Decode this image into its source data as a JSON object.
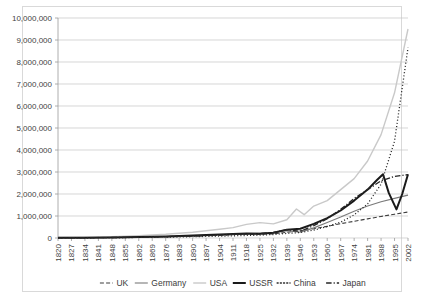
{
  "chart_data": {
    "type": "line",
    "title": "",
    "xlabel": "",
    "ylabel": "",
    "ylim": [
      0,
      10000000
    ],
    "ytick_values": [
      0,
      1000000,
      2000000,
      3000000,
      4000000,
      5000000,
      6000000,
      7000000,
      8000000,
      9000000,
      10000000
    ],
    "ytick_labels": [
      "0",
      "1,000,000",
      "2,000,000",
      "3,000,000",
      "4,000,000",
      "5,000,000",
      "6,000,000",
      "7,000,000",
      "8,000,000",
      "9,000,000",
      "10,000,000"
    ],
    "xlim": [
      1820,
      2002
    ],
    "xtick_labels": [
      "1820",
      "1827",
      "1834",
      "1841",
      "1848",
      "1855",
      "1862",
      "1869",
      "1876",
      "1883",
      "1890",
      "1897",
      "1904",
      "1911",
      "1918",
      "1925",
      "1932",
      "1939",
      "1946",
      "1953",
      "1960",
      "1967",
      "1974",
      "1981",
      "1988",
      "1995",
      "2002"
    ],
    "grid": "horizontal",
    "legend_position": "bottom",
    "series": [
      {
        "name": "UK",
        "style": "dashed",
        "color": "#3d3d3d",
        "width": 1.1,
        "dash": "4,2.2",
        "x": [
          1820,
          1834,
          1848,
          1862,
          1876,
          1890,
          1904,
          1918,
          1925,
          1932,
          1939,
          1946,
          1953,
          1960,
          1967,
          1974,
          1981,
          1988,
          1995,
          2002
        ],
        "y": [
          12000,
          20000,
          32000,
          48000,
          70000,
          95000,
          130000,
          180000,
          170000,
          190000,
          260000,
          330000,
          420000,
          530000,
          650000,
          760000,
          870000,
          980000,
          1080000,
          1180000
        ]
      },
      {
        "name": "Germany",
        "style": "solid",
        "color": "#7a7a7a",
        "width": 1.1,
        "dash": "",
        "x": [
          1820,
          1834,
          1848,
          1862,
          1876,
          1890,
          1904,
          1918,
          1925,
          1932,
          1939,
          1946,
          1953,
          1960,
          1967,
          1974,
          1981,
          1988,
          1995,
          2002
        ],
        "y": [
          8000,
          14000,
          24000,
          40000,
          65000,
          100000,
          150000,
          200000,
          210000,
          230000,
          330000,
          260000,
          460000,
          700000,
          950000,
          1220000,
          1450000,
          1650000,
          1800000,
          1950000
        ]
      },
      {
        "name": "USA",
        "style": "solid",
        "color": "#c9c9c9",
        "width": 1.4,
        "dash": "",
        "x": [
          1820,
          1834,
          1848,
          1862,
          1876,
          1890,
          1904,
          1911,
          1918,
          1925,
          1932,
          1939,
          1944,
          1948,
          1953,
          1960,
          1967,
          1974,
          1981,
          1988,
          1995,
          2002
        ],
        "y": [
          20000,
          35000,
          60000,
          110000,
          170000,
          260000,
          400000,
          470000,
          620000,
          700000,
          640000,
          830000,
          1320000,
          1060000,
          1450000,
          1700000,
          2200000,
          2700000,
          3500000,
          4700000,
          6600000,
          9500000
        ]
      },
      {
        "name": "USSR",
        "style": "solid-bold",
        "color": "#1a1a1a",
        "width": 2.0,
        "dash": "",
        "x": [
          1820,
          1834,
          1848,
          1862,
          1876,
          1890,
          1904,
          1918,
          1925,
          1932,
          1939,
          1946,
          1953,
          1960,
          1967,
          1974,
          1981,
          1986,
          1989,
          1992,
          1996,
          1999,
          2002
        ],
        "y": [
          10000,
          16000,
          28000,
          45000,
          70000,
          110000,
          160000,
          200000,
          190000,
          240000,
          380000,
          420000,
          640000,
          900000,
          1250000,
          1700000,
          2200000,
          2650000,
          2900000,
          2050000,
          1300000,
          2000000,
          2900000
        ]
      },
      {
        "name": "China",
        "style": "dotted",
        "color": "#2b2b2b",
        "width": 1.3,
        "dash": "1.1,2.1",
        "x": [
          1820,
          1834,
          1848,
          1862,
          1876,
          1890,
          1904,
          1918,
          1925,
          1932,
          1939,
          1946,
          1953,
          1960,
          1967,
          1974,
          1981,
          1988,
          1995,
          2002
        ],
        "y": [
          6000,
          10000,
          16000,
          26000,
          40000,
          60000,
          85000,
          115000,
          130000,
          160000,
          210000,
          250000,
          360000,
          520000,
          720000,
          1050000,
          1550000,
          2450000,
          4400000,
          8650000
        ]
      },
      {
        "name": "Japan",
        "style": "dash-dot",
        "color": "#262626",
        "width": 1.4,
        "dash": "5.5,2,1.2,2",
        "x": [
          1820,
          1834,
          1848,
          1862,
          1876,
          1890,
          1904,
          1918,
          1925,
          1932,
          1939,
          1946,
          1953,
          1960,
          1967,
          1974,
          1981,
          1988,
          1995,
          2002
        ],
        "y": [
          7000,
          12000,
          20000,
          34000,
          55000,
          85000,
          130000,
          190000,
          200000,
          250000,
          380000,
          300000,
          560000,
          880000,
          1300000,
          1800000,
          2200000,
          2600000,
          2800000,
          2880000
        ]
      }
    ],
    "legend": [
      {
        "label": "UK",
        "style": "dashed",
        "color": "#3d3d3d",
        "dash": "4,2.2",
        "width": 1.1
      },
      {
        "label": "Germany",
        "style": "solid",
        "color": "#7a7a7a",
        "dash": "",
        "width": 1.1
      },
      {
        "label": "USA",
        "style": "solid",
        "color": "#c9c9c9",
        "dash": "",
        "width": 1.4
      },
      {
        "label": "USSR",
        "style": "solid-bold",
        "color": "#1a1a1a",
        "dash": "",
        "width": 2.0
      },
      {
        "label": "China",
        "style": "dotted",
        "color": "#2b2b2b",
        "dash": "1.1,2.1",
        "width": 1.3
      },
      {
        "label": "Japan",
        "style": "dash-dot",
        "color": "#262626",
        "dash": "5.5,2,1.2,2",
        "width": 1.4
      }
    ]
  }
}
